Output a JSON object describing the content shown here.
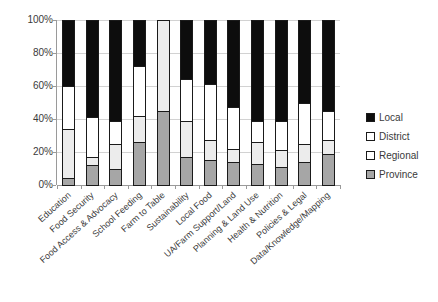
{
  "chart_data": {
    "type": "bar",
    "subtype": "stacked-100-percent",
    "title": "",
    "subtitle": "",
    "xlabel": "",
    "ylabel": "",
    "ylim": [
      0,
      100
    ],
    "ytick_labels": [
      "0%",
      "20%",
      "40%",
      "60%",
      "80%",
      "100%"
    ],
    "ytick_values": [
      0,
      20,
      40,
      60,
      80,
      100
    ],
    "grid": true,
    "legend_position": "right",
    "stack_order_bottom_to_top": [
      "Province",
      "Regional",
      "District",
      "Local"
    ],
    "categories": [
      "Education",
      "Food Security",
      "Food Access & Advocacy",
      "School Feeding",
      "Farm to Table",
      "Sustainability",
      "Local Food",
      "UA/Farm Support/Land",
      "Planning & Land Use",
      "Health & Nutrition",
      "Policies & Legal",
      "Data/Knowledge/Mapping"
    ],
    "series": [
      {
        "name": "Province",
        "color": "#a6a6a6",
        "values": [
          4,
          12,
          10,
          26,
          45,
          17,
          15,
          14,
          13,
          11,
          14,
          19
        ]
      },
      {
        "name": "Regional",
        "color": "#ececec",
        "values": [
          30,
          5,
          15,
          16,
          55,
          22,
          12,
          8,
          13,
          10,
          11,
          8
        ]
      },
      {
        "name": "District",
        "color": "#ffffff",
        "values": [
          26,
          24,
          14,
          30,
          0,
          25,
          34,
          25,
          13,
          18,
          25,
          18
        ]
      },
      {
        "name": "Local",
        "color": "#0d0d0d",
        "values": [
          40,
          59,
          61,
          28,
          0,
          36,
          39,
          53,
          61,
          61,
          50,
          55
        ]
      }
    ]
  },
  "legend": {
    "items": [
      {
        "label": "Local",
        "color": "#0d0d0d"
      },
      {
        "label": "District",
        "color": "#ffffff"
      },
      {
        "label": "Regional",
        "color": "#ffffff"
      },
      {
        "label": "Province",
        "color": "#a6a6a6"
      }
    ]
  }
}
